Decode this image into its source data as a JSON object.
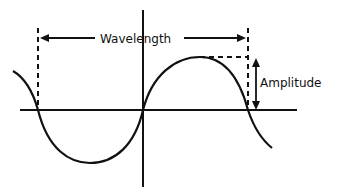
{
  "diagram": {
    "type": "sine-wave",
    "labels": {
      "wavelength": "Wavelength",
      "amplitude": "Amplitude"
    },
    "colors": {
      "stroke": "#111111",
      "background": "#ffffff"
    }
  }
}
